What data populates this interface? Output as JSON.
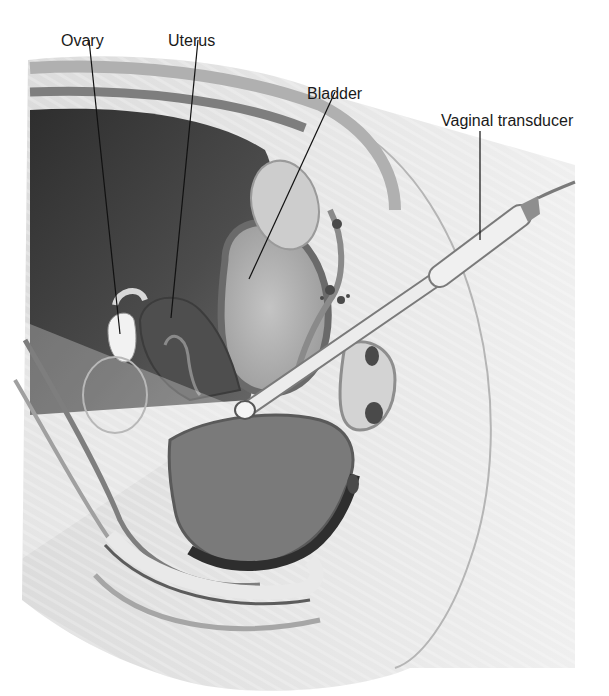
{
  "figure": {
    "type": "anatomical-illustration",
    "labels": [
      {
        "id": "ovary",
        "text": "Ovary",
        "x": 61,
        "y": 33
      },
      {
        "id": "uterus",
        "text": "Uterus",
        "x": 168,
        "y": 33
      },
      {
        "id": "bladder",
        "text": "Bladder",
        "x": 307,
        "y": 86
      },
      {
        "id": "vaginal-transducer",
        "text": "Vaginal transducer",
        "x": 441,
        "y": 113
      }
    ],
    "colors": {
      "background": "#ffffff",
      "skin": "#e4e4e4",
      "tissue_light": "#d6d6d6",
      "tissue_mid": "#a8a8a8",
      "tissue_dark": "#5a5a5a",
      "cavity": "#454545",
      "transducer": "#eeeeee",
      "outline": "#6e6e6e",
      "leader_line": "#111111"
    }
  }
}
